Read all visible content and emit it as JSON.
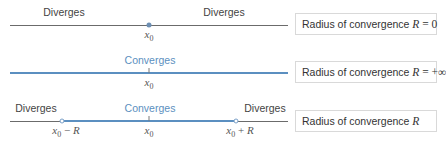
{
  "diagrams": [
    {
      "case": "radius-zero",
      "left_label": "Diverges",
      "right_label": "Diverges",
      "center_point": "x0",
      "center_marker": "filled-dot",
      "box": {
        "text": "Radius of convergence",
        "variable": "R",
        "equals": " = ",
        "value": "0"
      }
    },
    {
      "case": "radius-infinite",
      "center_label": "Converges",
      "center_point": "x0",
      "box": {
        "text": "Radius of convergence",
        "variable": "R",
        "equals": " = ",
        "value": "+∞"
      }
    },
    {
      "case": "radius-finite",
      "left_label": "Diverges",
      "center_label": "Converges",
      "right_label": "Diverges",
      "left_point": {
        "base": "x",
        "sub": "0",
        "op": " − ",
        "var": "R"
      },
      "center_point": "x0",
      "right_point": {
        "base": "x",
        "sub": "0",
        "op": " + ",
        "var": "R"
      },
      "endpoint_marker": "open-circle",
      "box": {
        "text": "Radius of convergence",
        "variable": "R",
        "equals": "",
        "value": ""
      }
    }
  ],
  "colors": {
    "diverge_line": "#6b6b6b",
    "converge_line": "#5b8fc0",
    "converge_text": "#5b8fc0",
    "box_border": "#d9d9d9"
  },
  "sym": {
    "x": "x",
    "zero": "0"
  }
}
